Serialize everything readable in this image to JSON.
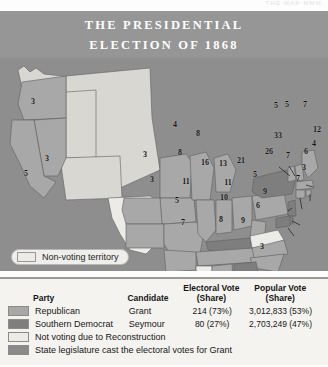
{
  "runhead": "THE  MAP   MMM",
  "title": {
    "line1": "THE PRESIDENTIAL",
    "line2": "ELECTION OF 1868"
  },
  "colors": {
    "background": "#8e8e8e",
    "title_band": "#969696",
    "republican": "#a8a8a8",
    "southern_democrat": "#7e7e7e",
    "not_voting": "#ecebe6",
    "state_legislature": "#8a8a8a",
    "land_light": "#d8d7d2",
    "legend_bg": "#f4f3ef"
  },
  "territory_legend": {
    "label": "Non-voting territory",
    "swatch": "#ecebe6"
  },
  "legend": {
    "headers": {
      "party": "Party",
      "candidate": "Candidate",
      "electoral_line1": "Electoral Vote",
      "electoral_line2": "(Share)",
      "popular_line1": "Popular Vote",
      "popular_line2": "(Share)"
    },
    "rows": [
      {
        "swatch": "#a8a8a8",
        "party": "Republican",
        "candidate": "Grant",
        "electoral": "214 (73%)",
        "popular": "3,012,833 (53%)"
      },
      {
        "swatch": "#7e7e7e",
        "party": "Southern Democrat",
        "candidate": "Seymour",
        "electoral": "80 (27%)",
        "popular": "2,703,249 (47%)"
      }
    ],
    "notes": [
      {
        "swatch": "#ecebe6",
        "text": "Not voting due to Reconstruction"
      },
      {
        "swatch": "#8a8a8a",
        "text": "State legislature cast the electoral votes for Grant"
      }
    ]
  },
  "chart_data": {
    "type": "map",
    "title": "THE PRESIDENTIAL ELECTION OF 1868",
    "metric": "Electoral votes by state",
    "legend_categories": [
      "Republican",
      "Southern Democrat",
      "Not voting due to Reconstruction",
      "State legislature cast the electoral votes for Grant"
    ],
    "totals": {
      "republican": {
        "candidate": "Grant",
        "electoral": 214,
        "electoral_share": "73%",
        "popular": "3,012,833",
        "popular_share": "53%"
      },
      "southern_democrat": {
        "candidate": "Seymour",
        "electoral": 80,
        "electoral_share": "27%",
        "popular": "2,703,249",
        "popular_share": "47%"
      }
    },
    "states": [
      {
        "code": "OR",
        "votes": "3",
        "party": "republican",
        "x": 33,
        "y": 101
      },
      {
        "code": "NV",
        "votes": "3",
        "party": "republican",
        "x": 47,
        "y": 158
      },
      {
        "code": "CA",
        "votes": "5",
        "party": "republican",
        "x": 26,
        "y": 173
      },
      {
        "code": "MN",
        "votes": "4",
        "party": "republican",
        "x": 175,
        "y": 124
      },
      {
        "code": "WI",
        "votes": "8",
        "party": "republican",
        "x": 198,
        "y": 133
      },
      {
        "code": "IA",
        "votes": "8",
        "party": "republican",
        "x": 180,
        "y": 152
      },
      {
        "code": "NE",
        "votes": "3",
        "party": "republican",
        "x": 145,
        "y": 154
      },
      {
        "code": "KS",
        "votes": "3",
        "party": "republican",
        "x": 152,
        "y": 179
      },
      {
        "code": "MO",
        "votes": "11",
        "party": "republican",
        "x": 186,
        "y": 181
      },
      {
        "code": "IL",
        "votes": "16",
        "party": "republican",
        "x": 205,
        "y": 162
      },
      {
        "code": "IN",
        "votes": "13",
        "party": "republican",
        "x": 223,
        "y": 163
      },
      {
        "code": "OH",
        "votes": "21",
        "party": "republican",
        "x": 241,
        "y": 160
      },
      {
        "code": "WV",
        "votes": "5",
        "party": "republican",
        "x": 255,
        "y": 174
      },
      {
        "code": "KY",
        "votes": "11",
        "party": "southern_democrat",
        "x": 228,
        "y": 182
      },
      {
        "code": "TN",
        "votes": "10",
        "party": "republican",
        "x": 224,
        "y": 197
      },
      {
        "code": "AR",
        "votes": "5",
        "party": "republican",
        "x": 177,
        "y": 200
      },
      {
        "code": "LA",
        "votes": "7",
        "party": "republican",
        "x": 183,
        "y": 222
      },
      {
        "code": "AL",
        "votes": "8",
        "party": "republican",
        "x": 221,
        "y": 219
      },
      {
        "code": "GA",
        "votes": "9",
        "party": "southern_democrat",
        "x": 243,
        "y": 220
      },
      {
        "code": "FL",
        "votes": "3",
        "party": "republican",
        "x": 262,
        "y": 246
      },
      {
        "code": "SC",
        "votes": "6",
        "party": "republican",
        "x": 258,
        "y": 205
      },
      {
        "code": "NC",
        "votes": "9",
        "party": "republican",
        "x": 265,
        "y": 191
      },
      {
        "code": "PA",
        "votes": "26",
        "party": "republican",
        "x": 269,
        "y": 151
      },
      {
        "code": "NY",
        "votes": "33",
        "party": "southern_democrat",
        "x": 278,
        "y": 135
      },
      {
        "code": "VT",
        "votes": "5",
        "party": "republican",
        "x": 287,
        "y": 104
      },
      {
        "code": "NH",
        "votes": "5",
        "party": "republican",
        "x": 276,
        "y": 105
      },
      {
        "code": "ME",
        "votes": "7",
        "party": "republican",
        "x": 305,
        "y": 104
      },
      {
        "code": "MA",
        "votes": "12",
        "party": "republican",
        "x": 317,
        "y": 129
      },
      {
        "code": "RI",
        "votes": "4",
        "party": "republican",
        "x": 314,
        "y": 143
      },
      {
        "code": "CT",
        "votes": "6",
        "party": "republican",
        "x": 306,
        "y": 151
      },
      {
        "code": "NJ",
        "votes": "7",
        "party": "southern_democrat",
        "x": 288,
        "y": 155
      },
      {
        "code": "DE",
        "votes": "3",
        "party": "southern_democrat",
        "x": 304,
        "y": 167
      },
      {
        "code": "MD",
        "votes": "7",
        "party": "southern_democrat",
        "x": 298,
        "y": 178
      }
    ],
    "non_voting_states": [
      "TX",
      "MS",
      "VA"
    ],
    "territories_label": "Non-voting territory"
  }
}
